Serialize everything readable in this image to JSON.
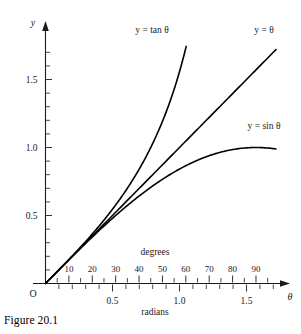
{
  "figure": {
    "caption": "Figure 20.1",
    "origin_label": "O"
  },
  "axes": {
    "y_axis_name": "y",
    "x_axis_name": "θ",
    "degrees_label": "degrees",
    "radians_label": "radians",
    "y_tick_labels": [
      "0.5",
      "1.0",
      "1.5"
    ],
    "y_tick_values": [
      0.5,
      1.0,
      1.5
    ],
    "degree_tick_labels": [
      "10",
      "20",
      "30",
      "40",
      "50",
      "60",
      "70",
      "80",
      "90"
    ],
    "degree_tick_values": [
      10,
      20,
      30,
      40,
      50,
      60,
      70,
      80,
      90
    ],
    "radian_tick_labels": [
      "0.5",
      "1.0",
      "1.5"
    ],
    "radian_tick_values": [
      0.5,
      1.0,
      1.5
    ]
  },
  "curve_labels": {
    "tan": "y = tan θ",
    "theta": "y = θ",
    "sin": "y = sin θ"
  },
  "colors": {
    "ink": "#1a1a1a",
    "curve": "#000000",
    "background": "#ffffff"
  },
  "chart_data": {
    "type": "line",
    "title": "Figure 20.1",
    "xlabel": "θ",
    "ylabel": "y",
    "xlim": [
      0,
      1.72
    ],
    "ylim": [
      0,
      1.78
    ],
    "grid": false,
    "legend": "inline-curve-labels",
    "x_axis_dual_units": {
      "primary": "radians",
      "secondary": "degrees",
      "conversion": "90 degrees = 1.5708 radians"
    },
    "series": [
      {
        "name": "y = tan θ",
        "x": [
          0,
          0.1,
          0.2,
          0.3,
          0.4,
          0.5,
          0.6,
          0.7,
          0.8,
          0.9,
          0.95,
          1.0,
          1.03
        ],
        "y": [
          0,
          0.1003,
          0.2027,
          0.3093,
          0.4228,
          0.5463,
          0.6841,
          0.8423,
          1.0296,
          1.2602,
          1.3984,
          1.5574,
          1.7036
        ]
      },
      {
        "name": "y = θ",
        "x": [
          0,
          0.25,
          0.5,
          0.75,
          1.0,
          1.25,
          1.5,
          1.72
        ],
        "y": [
          0,
          0.25,
          0.5,
          0.75,
          1.0,
          1.25,
          1.5,
          1.72
        ]
      },
      {
        "name": "y = sin θ",
        "x": [
          0,
          0.2,
          0.4,
          0.6,
          0.8,
          1.0,
          1.2,
          1.4,
          1.5708,
          1.72
        ],
        "y": [
          0,
          0.1987,
          0.3894,
          0.5646,
          0.7174,
          0.8415,
          0.932,
          0.9854,
          1.0,
          0.9889
        ]
      }
    ]
  }
}
